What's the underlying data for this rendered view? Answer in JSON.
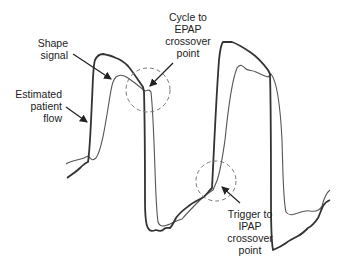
{
  "diagram": {
    "title": "",
    "colors": {
      "background": "#ffffff",
      "shape_signal": "#333333",
      "patient_flow": "#555555",
      "annotation": "#222222",
      "dashed_circle": "#777777"
    },
    "curves": [
      {
        "name": "Shape signal",
        "style": "thick"
      },
      {
        "name": "Estimated patient flow",
        "style": "thin"
      }
    ],
    "labels": {
      "shape_signal": {
        "line1": "Shape",
        "line2": "signal"
      },
      "estimated_flow": {
        "line1": "Estimated",
        "line2": "patient",
        "line3": "flow"
      },
      "cycle": {
        "line1": "Cycle to",
        "line2": "EPAP",
        "line3": "crossover",
        "line4": "point"
      },
      "trigger": {
        "line1": "Trigger to",
        "line2": "IPAP",
        "line3": "crossover",
        "line4": "point"
      }
    }
  }
}
